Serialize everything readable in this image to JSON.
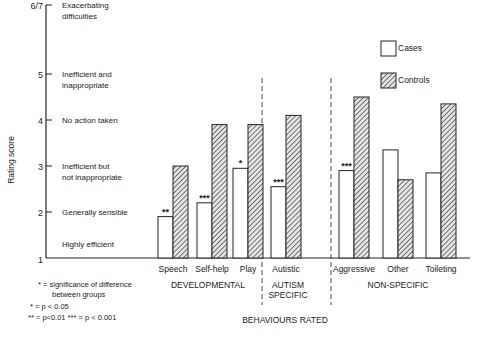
{
  "chart_data": {
    "type": "bar",
    "title": "",
    "xlabel": "BEHAVIOURS RATED",
    "ylabel": "Rating score",
    "ylim": [
      1,
      6.5
    ],
    "y_ticks": [
      {
        "value": 6.5,
        "label": "6/7"
      },
      {
        "value": 5,
        "label": "5"
      },
      {
        "value": 4,
        "label": "4"
      },
      {
        "value": 3,
        "label": "3"
      },
      {
        "value": 2,
        "label": "2"
      },
      {
        "value": 1,
        "label": "1"
      }
    ],
    "y_descriptors": [
      {
        "value": 6.5,
        "lines": [
          "Exacerbating",
          "difficulties"
        ]
      },
      {
        "value": 5,
        "lines": [
          "Inefficient and",
          "inappropriate"
        ]
      },
      {
        "value": 4,
        "lines": [
          "No action taken"
        ]
      },
      {
        "value": 3,
        "lines": [
          "Inefficient but",
          "not inappropriate"
        ]
      },
      {
        "value": 2,
        "lines": [
          "Generally sensible"
        ]
      },
      {
        "value": 1.3,
        "lines": [
          "Highly efficient"
        ]
      }
    ],
    "categories": [
      "Speech",
      "Self-help",
      "Play",
      "Autistic",
      "Aggressive",
      "Other",
      "Toileting"
    ],
    "series": [
      {
        "name": "Cases",
        "pattern": "open",
        "values": [
          1.9,
          2.2,
          2.95,
          2.55,
          2.9,
          3.35,
          2.85
        ]
      },
      {
        "name": "Controls",
        "pattern": "hatched",
        "values": [
          3.0,
          3.9,
          3.9,
          4.1,
          4.5,
          2.7,
          4.35
        ]
      }
    ],
    "significance": [
      "**",
      "***",
      "*",
      "***",
      "***",
      "",
      ""
    ],
    "groups": [
      {
        "label": "DEVELOPMENTAL",
        "categories": [
          "Speech",
          "Self-help",
          "Play"
        ]
      },
      {
        "label": "AUTISM SPECIFIC",
        "lines": [
          "AUTISM",
          "SPECIFIC"
        ],
        "categories": [
          "Autistic"
        ]
      },
      {
        "label": "NON-SPECIFIC",
        "categories": [
          "Aggressive",
          "Other",
          "Toileting"
        ]
      }
    ],
    "legend": {
      "position": "upper right",
      "entries": [
        "Cases",
        "Controls"
      ]
    },
    "notes": [
      "* = significance of difference",
      "between groups",
      "* = p < 0.05",
      "** = p<0.01  *** = p < 0.001"
    ],
    "grid": false
  }
}
